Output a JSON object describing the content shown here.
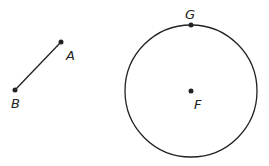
{
  "diagram": {
    "segment": {
      "from": {
        "label": "A",
        "x": 61,
        "y": 42,
        "label_x": 66,
        "label_y": 60
      },
      "to": {
        "label": "B",
        "x": 15,
        "y": 90,
        "label_x": 11,
        "label_y": 108
      }
    },
    "circle": {
      "center": {
        "label": "F",
        "x": 191,
        "y": 91,
        "label_x": 194,
        "label_y": 109
      },
      "radius": 66,
      "point_on_circle": {
        "label": "G",
        "x": 191,
        "y": 25,
        "label_x": 185,
        "label_y": 19
      }
    },
    "stroke_color": "#222222"
  }
}
